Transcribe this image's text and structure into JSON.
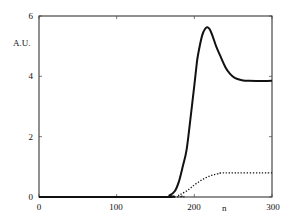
{
  "chart_data": {
    "type": "line",
    "title": "",
    "xlabel": "n",
    "ylabel": "A.U.",
    "xlim": [
      0,
      300
    ],
    "ylim": [
      0,
      6
    ],
    "xticks": [
      0,
      100,
      200,
      300
    ],
    "yticks": [
      0,
      2,
      4,
      6
    ],
    "xtick_labels": [
      "0",
      "100",
      "200",
      "300"
    ],
    "ytick_labels": [
      "0",
      "2",
      "4",
      "6"
    ],
    "grid": false,
    "legend": null,
    "series": [
      {
        "name": "solid",
        "style": "solid",
        "color": "#111111",
        "points": [
          [
            0,
            0
          ],
          [
            160,
            0
          ],
          [
            168,
            0.05
          ],
          [
            175,
            0.2
          ],
          [
            180,
            0.5
          ],
          [
            185,
            1.0
          ],
          [
            190,
            1.56
          ],
          [
            195,
            2.6
          ],
          [
            200,
            3.7
          ],
          [
            203,
            4.4
          ],
          [
            205,
            4.75
          ],
          [
            210,
            5.35
          ],
          [
            214,
            5.58
          ],
          [
            217,
            5.63
          ],
          [
            220,
            5.55
          ],
          [
            224,
            5.3
          ],
          [
            228,
            5.0
          ],
          [
            233,
            4.7
          ],
          [
            240,
            4.3
          ],
          [
            246,
            4.08
          ],
          [
            252,
            3.95
          ],
          [
            260,
            3.88
          ],
          [
            270,
            3.85
          ],
          [
            300,
            3.85
          ]
        ]
      },
      {
        "name": "dotted",
        "style": "dotted",
        "color": "#111111",
        "points": [
          [
            0,
            0
          ],
          [
            172,
            0
          ],
          [
            180,
            0.06
          ],
          [
            190,
            0.2
          ],
          [
            200,
            0.4
          ],
          [
            210,
            0.57
          ],
          [
            220,
            0.7
          ],
          [
            230,
            0.77
          ],
          [
            240,
            0.8
          ],
          [
            300,
            0.8
          ]
        ]
      }
    ]
  }
}
